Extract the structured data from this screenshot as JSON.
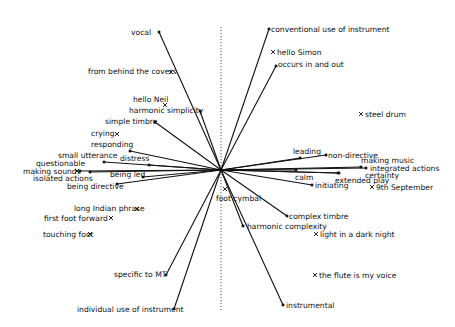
{
  "diagram": {
    "type": "biplot",
    "origin": {
      "x": 221,
      "y": 170
    },
    "axis": {
      "x": 221,
      "y_top": 27,
      "y_bottom": 310,
      "style": "dotted"
    },
    "colors": {
      "line": "#111111",
      "text": "#111111",
      "axis": "#555555",
      "background": "#ffffff"
    },
    "vectors": [
      {
        "id": "vocal",
        "label": "vocal",
        "end": [
          159,
          32
        ],
        "label_pos": [
          131,
          35
        ],
        "anchor": "start"
      },
      {
        "id": "conventional-use-of-instrument",
        "label": "conventional use of instrument",
        "end": [
          269,
          29
        ],
        "label_pos": [
          271,
          32
        ],
        "anchor": "start"
      },
      {
        "id": "occurs-in-and-out",
        "label": "occurs in and out",
        "end": [
          276,
          66
        ],
        "label_pos": [
          278,
          67
        ],
        "anchor": "start"
      },
      {
        "id": "harmonic-simplicity",
        "label": "harmonic simplicity",
        "end": [
          200,
          111
        ],
        "label_pos": [
          129,
          113
        ],
        "anchor": "start"
      },
      {
        "id": "simple-timbre",
        "label": "simple timbre",
        "end": [
          155,
          122
        ],
        "label_pos": [
          105,
          124
        ],
        "anchor": "start"
      },
      {
        "id": "responding",
        "label": "responding",
        "end": [
          130,
          151
        ],
        "label_pos": [
          91,
          147
        ],
        "anchor": "start"
      },
      {
        "id": "small-utterance",
        "label": "small utterance",
        "end": [
          104,
          162
        ],
        "label_pos": [
          58,
          158
        ],
        "anchor": "start"
      },
      {
        "id": "distress",
        "label": "distress",
        "end": [
          149,
          165
        ],
        "label_pos": [
          120,
          161
        ],
        "anchor": "start"
      },
      {
        "id": "questionable",
        "label": "questionable",
        "end": [
          80,
          171
        ],
        "label_pos": [
          36,
          166
        ],
        "anchor": "start"
      },
      {
        "id": "isolated-actions",
        "label": "isolated actions",
        "end": [
          90,
          172
        ],
        "label_pos": [
          33,
          181
        ],
        "anchor": "start"
      },
      {
        "id": "being-led",
        "label": "being led",
        "end": [
          143,
          177
        ],
        "label_pos": [
          110,
          177
        ],
        "anchor": "start"
      },
      {
        "id": "being-directive",
        "label": "being directive",
        "end": [
          117,
          184
        ],
        "label_pos": [
          67,
          189
        ],
        "anchor": "start"
      },
      {
        "id": "leading",
        "label": "leading",
        "end": [
          300,
          158
        ],
        "label_pos": [
          293,
          154
        ],
        "anchor": "start"
      },
      {
        "id": "non-directive",
        "label": "non-directive",
        "end": [
          326,
          155
        ],
        "label_pos": [
          328,
          158
        ],
        "anchor": "start"
      },
      {
        "id": "making-music",
        "label": "making music",
        "end": [
          361,
          167
        ],
        "label_pos": [
          361,
          163
        ],
        "anchor": "start"
      },
      {
        "id": "integrated-actions",
        "label": "integrated actions",
        "end": [
          366,
          168
        ],
        "label_pos": [
          370,
          171
        ],
        "anchor": "start"
      },
      {
        "id": "calm",
        "label": "calm",
        "end": [
          296,
          170
        ],
        "label_pos": [
          295,
          180
        ],
        "anchor": "start"
      },
      {
        "id": "certainty",
        "label": "certainty",
        "end": [
          339,
          173
        ],
        "label_pos": [
          365,
          178
        ],
        "anchor": "start"
      },
      {
        "id": "extended-play",
        "label": "extended play",
        "end": [
          338,
          173
        ],
        "label_pos": [
          335,
          183
        ],
        "anchor": "start"
      },
      {
        "id": "initiating",
        "label": "initiating",
        "end": [
          312,
          185
        ],
        "label_pos": [
          315,
          188
        ],
        "anchor": "start"
      },
      {
        "id": "complex-timbre",
        "label": "complex timbre",
        "end": [
          287,
          216
        ],
        "label_pos": [
          289,
          219
        ],
        "anchor": "start"
      },
      {
        "id": "harmonic-complexity",
        "label": "harmonic complexity",
        "end": [
          243,
          226
        ],
        "label_pos": [
          247,
          229
        ],
        "anchor": "start"
      },
      {
        "id": "instrumental",
        "label": "instrumental",
        "end": [
          283,
          305
        ],
        "label_pos": [
          286,
          308
        ],
        "anchor": "start"
      },
      {
        "id": "specific-to-mt",
        "label": "specific to MT",
        "end": [
          166,
          275
        ],
        "label_pos": [
          114,
          277
        ],
        "anchor": "start"
      },
      {
        "id": "individual-use-of-instrument",
        "label": "individual use of instrument",
        "end": [
          174,
          309
        ],
        "label_pos": [
          77,
          312
        ],
        "anchor": "start"
      }
    ],
    "points": [
      {
        "id": "from-behind-the-covers",
        "label": "from behind the covers",
        "marker": [
          171,
          72
        ],
        "label_pos": [
          88,
          74
        ],
        "anchor": "start"
      },
      {
        "id": "hello-simon",
        "label": "hello Simon",
        "marker": [
          273,
          52
        ],
        "label_pos": [
          277,
          55
        ],
        "anchor": "start"
      },
      {
        "id": "hello-neil",
        "label": "hello Neil",
        "marker": [
          165,
          105
        ],
        "label_pos": [
          133,
          102
        ],
        "anchor": "start"
      },
      {
        "id": "crying",
        "label": "crying",
        "marker": [
          117,
          134
        ],
        "label_pos": [
          91,
          136
        ],
        "anchor": "start"
      },
      {
        "id": "making-sounds",
        "label": "making sounds",
        "marker": [
          77,
          171
        ],
        "label_pos": [
          23,
          174
        ],
        "anchor": "start"
      },
      {
        "id": "steel-drum",
        "label": "steel drum",
        "marker": [
          361,
          114
        ],
        "label_pos": [
          365,
          117
        ],
        "anchor": "start"
      },
      {
        "id": "9th-september",
        "label": "9th September",
        "marker": [
          372,
          187
        ],
        "label_pos": [
          376,
          190
        ],
        "anchor": "start"
      },
      {
        "id": "foot-cymbal",
        "label": "foot cymbal",
        "marker": [
          225,
          189
        ],
        "label_pos": [
          216,
          201
        ],
        "anchor": "start"
      },
      {
        "id": "light-in-a-dark-night",
        "label": "light in a dark night",
        "marker": [
          316,
          234
        ],
        "label_pos": [
          320,
          237
        ],
        "anchor": "start"
      },
      {
        "id": "the-flute-is-my-voice",
        "label": "the flute is my voice",
        "marker": [
          315,
          275
        ],
        "label_pos": [
          319,
          278
        ],
        "anchor": "start"
      },
      {
        "id": "long-indian-phrase",
        "label": "long Indian phrase",
        "marker": [
          137,
          209
        ],
        "label_pos": [
          74,
          211
        ],
        "anchor": "start"
      },
      {
        "id": "first-foot-forward",
        "label": "first foot forward",
        "marker": [
          111,
          218
        ],
        "label_pos": [
          44,
          221
        ],
        "anchor": "start"
      },
      {
        "id": "touching-foot",
        "label": "touching foot",
        "marker": [
          90,
          234
        ],
        "label_pos": [
          43,
          237
        ],
        "anchor": "start"
      }
    ]
  }
}
